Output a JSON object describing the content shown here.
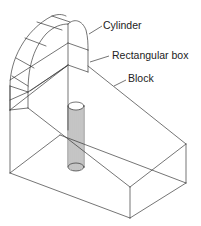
{
  "diagram": {
    "type": "isometric-wireframe",
    "labels": {
      "cylinder": "Cylinder",
      "rectangular_box": "Rectangular box",
      "block": "Block"
    },
    "parts": [
      "Cylinder",
      "Rectangular box",
      "Block",
      "Vertical cylinder (hole/pin)"
    ],
    "colors": {
      "line": "#3a3a3a",
      "text": "#222222",
      "background": "#ffffff"
    }
  }
}
